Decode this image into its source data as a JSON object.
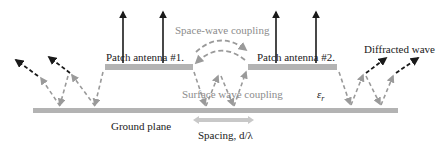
{
  "labels": {
    "patch1": "Patch antenna #1.",
    "patch2": "Patch antenna #2.",
    "space_wave": "Space-wave coupling",
    "surface_wave": "Surface wave coupling",
    "diffracted": "Diffracted wave",
    "ground": "Ground plane",
    "spacing": "Spacing, d/λ",
    "epsilon": "ε",
    "epsilon_sub": "r"
  },
  "colors": {
    "dark": "#1a1a1a",
    "gray_arrow": "#9a9a9a",
    "plate": "#b3b3b3",
    "spacing_arrow": "#c8c8c8"
  },
  "icons": {
    "radiation": "up-arrow",
    "diffracted": "dashed-arrow",
    "coupling": "dashed-gray-arrow",
    "spacing": "double-arrow"
  }
}
